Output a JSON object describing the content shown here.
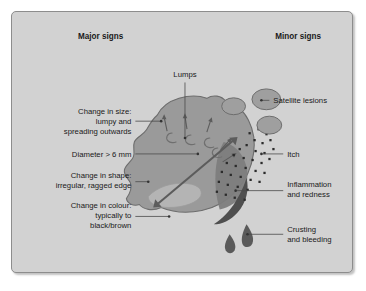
{
  "figure": {
    "background_color": "#d2d2d2",
    "border_color": "#8d8d8d",
    "headers": {
      "major": "Major signs",
      "minor": "Minor signs"
    }
  },
  "labels": {
    "lumps": "Lumps",
    "change_in_size": [
      "Change in size:",
      "lumpy and",
      "spreading outwards"
    ],
    "diameter": "Diameter > 6 mm",
    "change_in_shape": [
      "Change in shape:",
      "irregular, ragged edge"
    ],
    "change_in_colour": [
      "Change in colour:",
      "typically to",
      "black/brown"
    ],
    "satellite_lesions": "Satellite lesions",
    "itch": "Itch",
    "inflammation": [
      "Inflammation",
      "and redness"
    ],
    "crusting": [
      "Crusting",
      "and bleeding"
    ]
  },
  "colors": {
    "mole_fill": "#9a9a9a",
    "mole_stroke": "#6d6d6d",
    "inflamed_fill": "#7d7d7d",
    "light_patch_fill": "#b4b4b4",
    "satellite_fill": "#9f9f9f",
    "crust_fill": "#5a5a5a",
    "arrow_color": "#5c5c5c",
    "dot_color": "#2b2b2b",
    "text_color": "#1a1a1a"
  },
  "features": {
    "lump_arrow_count": 5,
    "lump_bump_count": 4,
    "satellite_lesion_count": 3,
    "itch_dot_count": 34,
    "blood_drop_count": 2,
    "diameter_arrow": "double-headed"
  }
}
